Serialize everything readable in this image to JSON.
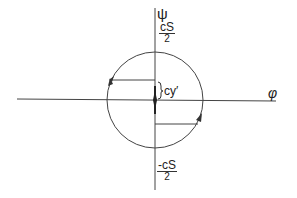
{
  "diagram": {
    "axes": {
      "vertical_label": "ψ",
      "horizontal_label": "φ"
    },
    "labels": {
      "top_fraction": {
        "numerator": "cS",
        "denominator": "2"
      },
      "bottom_fraction": {
        "numerator": "-cS",
        "denominator": "2"
      },
      "offset_label": "cy′"
    },
    "circle": {
      "center_x": 155,
      "center_y": 99,
      "radius": 47
    },
    "colors": {
      "stroke": "#333333",
      "background": "#ffffff"
    }
  }
}
